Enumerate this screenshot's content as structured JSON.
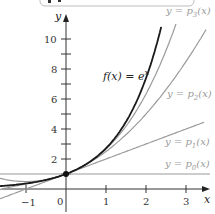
{
  "chart_data": {
    "type": "line",
    "title": "",
    "xlabel": "x",
    "ylabel": "y",
    "xlim": [
      -1.6,
      3.6
    ],
    "ylim": [
      -1.7,
      11.5
    ],
    "grid": false,
    "x_ticks": [
      -1,
      0,
      1,
      2,
      3
    ],
    "x_tick_labels": [
      "−1",
      "0",
      "1",
      "2",
      "3"
    ],
    "y_ticks": [
      1,
      2,
      3,
      4,
      5,
      6,
      7,
      8,
      9,
      10
    ],
    "y_tick_labels": [
      "2",
      "4",
      "6",
      "8",
      "10"
    ],
    "series": [
      {
        "name": "f(x) = e^x",
        "label": "f(x) = e^x",
        "expression": "e^x",
        "color": "#1a1a1a",
        "x": [
          -1.6,
          -1,
          -0.5,
          0,
          0.5,
          1,
          1.5,
          2,
          2.38
        ],
        "values": [
          0.2,
          0.37,
          0.61,
          1,
          1.65,
          2.72,
          4.48,
          7.39,
          10.8
        ]
      },
      {
        "name": "p0",
        "label": "y = p0(x)",
        "expression": "1",
        "color": "#9a9a9a",
        "x": [
          -1.6,
          3.6
        ],
        "values": [
          1,
          1
        ]
      },
      {
        "name": "p1",
        "label": "y = p1(x)",
        "expression": "1 + x",
        "color": "#9a9a9a",
        "x": [
          -1.6,
          3.4
        ],
        "values": [
          -0.6,
          4.4
        ]
      },
      {
        "name": "p2",
        "label": "y = p2(x)",
        "expression": "1 + x + x^2/2",
        "color": "#9a9a9a",
        "x": [
          -1.6,
          -1,
          0,
          1,
          2,
          3,
          3.5
        ],
        "values": [
          0.68,
          0.5,
          1,
          2.5,
          5,
          8.5,
          10.6
        ]
      },
      {
        "name": "p3",
        "label": "y = p3(x)",
        "expression": "1 + x + x^2/2 + x^3/6",
        "color": "#9a9a9a",
        "x": [
          -1.6,
          -1,
          0,
          1,
          2,
          2.75
        ],
        "values": [
          0.0,
          0.33,
          1,
          2.67,
          6.33,
          11.0
        ]
      }
    ],
    "annotations": [
      {
        "text": "f(x) = e^x",
        "x": 0.9,
        "y": 7.3
      },
      {
        "text": "y = p3(x)",
        "x": 2.6,
        "y": 11.7
      },
      {
        "text": "y = p2(x)",
        "x": 2.8,
        "y": 6.3
      },
      {
        "text": "y = p1(x)",
        "x": 2.8,
        "y": 2.2
      },
      {
        "text": "y = p0(x)",
        "x": 2.8,
        "y": 1.3
      }
    ],
    "highlight_point": {
      "x": 0,
      "y": 1
    }
  },
  "labels": {
    "x_axis": "x",
    "y_axis": "y",
    "f": "f(x) = e",
    "f_exp": "x",
    "p3": "y = p",
    "p3_sub": "3",
    "p2": "y = p",
    "p2_sub": "2",
    "p1": "y = p",
    "p1_sub": "1",
    "p0": "y = p",
    "p0_sub": "0",
    "arg": "(x)",
    "xt_m1": "−1",
    "xt_0": "0",
    "xt_1": "1",
    "xt_2": "2",
    "xt_3": "3",
    "yt_2": "2",
    "yt_4": "4",
    "yt_6": "6",
    "yt_8": "8",
    "yt_10": "10"
  }
}
